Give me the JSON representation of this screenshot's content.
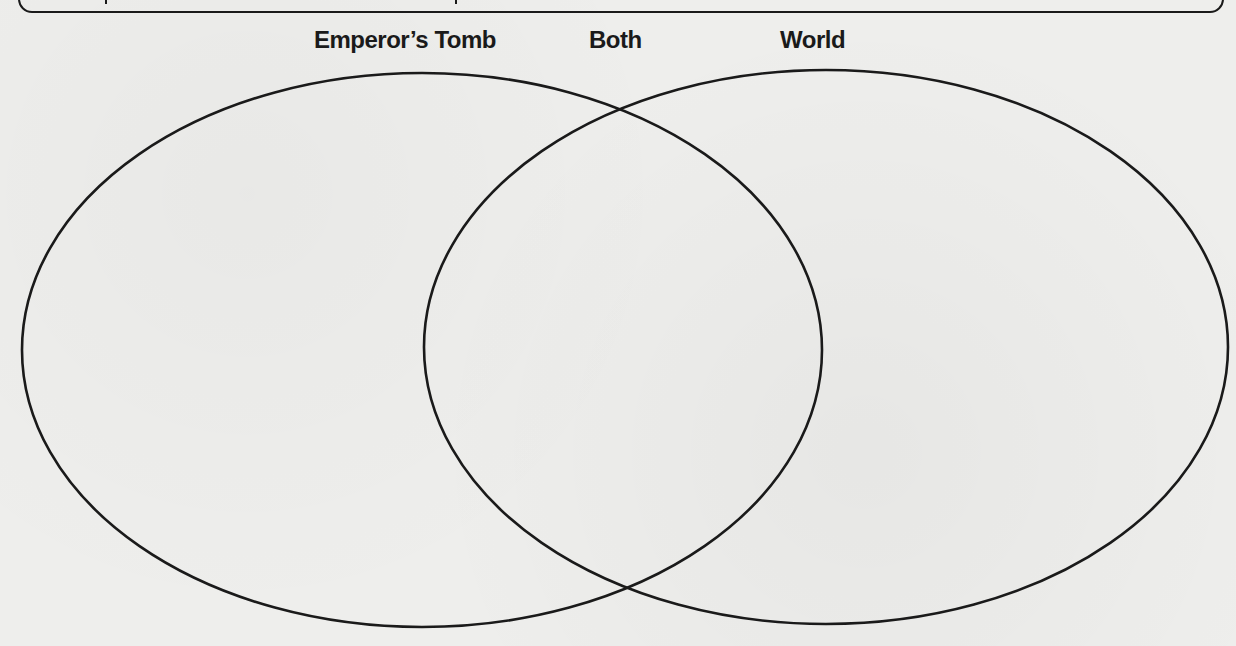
{
  "header": {
    "box": "partially-visible-rounded-box"
  },
  "venn": {
    "labels": {
      "left": "Emperor’s Tomb",
      "middle": "Both",
      "right": "World"
    },
    "left_circle": {
      "cx": 422,
      "cy": 350,
      "rx": 400,
      "ry": 277
    },
    "right_circle": {
      "cx": 826,
      "cy": 347,
      "rx": 402,
      "ry": 277
    },
    "stroke_color": "#1a1a1a",
    "background_color": "#eeeeec"
  }
}
